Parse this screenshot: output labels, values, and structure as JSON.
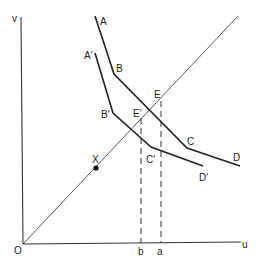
{
  "diagram": {
    "axes": {
      "y_label": "v",
      "x_label": "u",
      "origin_label": "O"
    },
    "diagonal_point": {
      "label": "X"
    },
    "curve_original": {
      "points": [
        "A",
        "B",
        "C",
        "D"
      ]
    },
    "curve_shifted": {
      "points": [
        "A'",
        "B'",
        "C'",
        "D'"
      ]
    },
    "equilibria": [
      {
        "label": "E",
        "axis_label": "a"
      },
      {
        "label": "E'",
        "axis_label": "b"
      }
    ],
    "colors": {
      "ink": "#222222",
      "background": "#ffffff"
    }
  }
}
